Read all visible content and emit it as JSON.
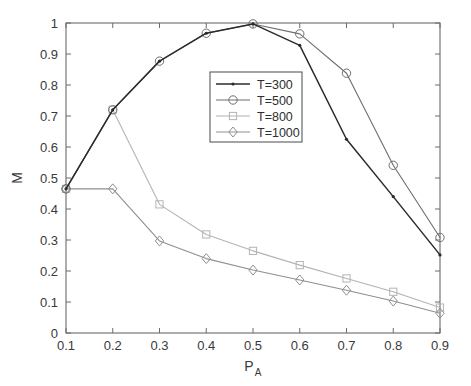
{
  "chart_data": {
    "type": "line",
    "title": "",
    "xlabel": "P_A",
    "xlabel_main": "P",
    "xlabel_sub": "A",
    "ylabel": "M",
    "xlim": [
      0.1,
      0.9
    ],
    "ylim": [
      0,
      1
    ],
    "grid": false,
    "legend_position": "upper-center",
    "x": [
      0.1,
      0.2,
      0.3,
      0.4,
      0.5,
      0.6,
      0.7,
      0.8,
      0.9
    ],
    "xticklabels": [
      "0.1",
      "0.2",
      "0.3",
      "0.4",
      "0.5",
      "0.6",
      "0.7",
      "0.8",
      "0.9"
    ],
    "yticklabels": [
      "0",
      "0.1",
      "0.2",
      "0.3",
      "0.4",
      "0.5",
      "0.6",
      "0.7",
      "0.8",
      "0.9",
      "1"
    ],
    "yticks": [
      0,
      0.1,
      0.2,
      0.3,
      0.4,
      0.5,
      0.6,
      0.7,
      0.8,
      0.9,
      1
    ],
    "series": [
      {
        "name": "T=300",
        "label": "T=300",
        "marker": "dot",
        "color": "#2b2b2b",
        "values": [
          0.465,
          0.72,
          0.877,
          0.967,
          0.997,
          0.928,
          0.625,
          0.44,
          0.252
        ]
      },
      {
        "name": "T=500",
        "label": "T=500",
        "marker": "circle",
        "color": "#6e6e6e",
        "values": [
          0.465,
          0.72,
          0.877,
          0.967,
          0.997,
          0.965,
          0.838,
          0.541,
          0.308
        ]
      },
      {
        "name": "T=800",
        "label": "T=800",
        "marker": "square",
        "color": "#b4b4b4",
        "values": [
          0.465,
          0.72,
          0.415,
          0.318,
          0.265,
          0.219,
          0.176,
          0.133,
          0.082
        ]
      },
      {
        "name": "T=1000",
        "label": "T=1000",
        "marker": "diamond",
        "color": "#8f8f8f",
        "values": [
          0.465,
          0.465,
          0.297,
          0.24,
          0.203,
          0.171,
          0.138,
          0.103,
          0.064
        ]
      }
    ]
  }
}
